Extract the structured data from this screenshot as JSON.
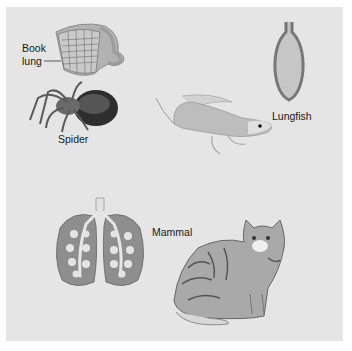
{
  "figure": {
    "background_color": "#e5e5e5",
    "labels": {
      "book_lung_line1": "Book",
      "book_lung_line2": "lung",
      "spider": "Spider",
      "lungfish": "Lungfish",
      "mammal": "Mammal"
    },
    "panels": [
      {
        "organism": "Spider",
        "structure": "Book lung",
        "icon": "book-lung-icon"
      },
      {
        "organism": "Lungfish",
        "structure": "Sac lung",
        "icon": "lungfish-lung-icon"
      },
      {
        "organism": "Mammal",
        "structure": "Alveolar lungs",
        "icon": "mammal-lungs-icon"
      }
    ],
    "colors": {
      "lung_tissue": "#8a8a8a",
      "lung_sac_fill": "#c4c4c4",
      "airway": "#e8e8e8",
      "book_lung": "#b0b0b0"
    }
  }
}
